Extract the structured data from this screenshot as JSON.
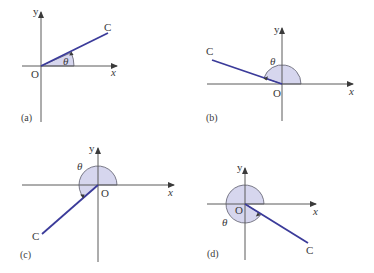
{
  "figure": {
    "panels": [
      {
        "id": "a",
        "caption": "(a)",
        "origin_label": "O",
        "x_label": "x",
        "y_label": "y",
        "point_label": "C",
        "angle_label": "θ",
        "quadrant": "I"
      },
      {
        "id": "b",
        "caption": "(b)",
        "origin_label": "O",
        "x_label": "x",
        "y_label": "y",
        "point_label": "C",
        "angle_label": "θ",
        "quadrant": "II"
      },
      {
        "id": "c",
        "caption": "(c)",
        "origin_label": "O",
        "x_label": "x",
        "y_label": "y",
        "point_label": "C",
        "angle_label": "θ",
        "quadrant": "III"
      },
      {
        "id": "d",
        "caption": "(d)",
        "origin_label": "O",
        "x_label": "x",
        "y_label": "y",
        "point_label": "C",
        "angle_label": "θ",
        "quadrant": "IV"
      }
    ]
  },
  "colors": {
    "ray": "#3b3b9a",
    "sector_fill": "#d6d6ee",
    "axis": "#5a5a5a",
    "text": "#3a3a3a"
  }
}
